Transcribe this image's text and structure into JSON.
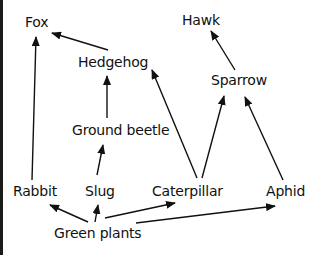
{
  "diagram": {
    "type": "food-web",
    "colors": {
      "line": "#111111",
      "text": "#111111",
      "background": "#ffffff"
    },
    "nodes": [
      {
        "id": "fox",
        "label": "Fox",
        "x": 25,
        "y": 14
      },
      {
        "id": "hawk",
        "label": "Hawk",
        "x": 182,
        "y": 12
      },
      {
        "id": "hedgehog",
        "label": "Hedgehog",
        "x": 78,
        "y": 54
      },
      {
        "id": "sparrow",
        "label": "Sparrow",
        "x": 211,
        "y": 72
      },
      {
        "id": "ground_beetle",
        "label": "Ground beetle",
        "x": 72,
        "y": 122
      },
      {
        "id": "rabbit",
        "label": "Rabbit",
        "x": 13,
        "y": 183
      },
      {
        "id": "slug",
        "label": "Slug",
        "x": 85,
        "y": 183
      },
      {
        "id": "caterpillar",
        "label": "Caterpillar",
        "x": 152,
        "y": 183
      },
      {
        "id": "aphid",
        "label": "Aphid",
        "x": 266,
        "y": 183
      },
      {
        "id": "green_plants",
        "label": "Green plants",
        "x": 54,
        "y": 225
      }
    ],
    "edges": [
      {
        "from": "hedgehog",
        "to": "fox",
        "x1": 108,
        "y1": 50,
        "x2": 52,
        "y2": 33
      },
      {
        "from": "rabbit",
        "to": "fox",
        "x1": 32,
        "y1": 180,
        "x2": 36,
        "y2": 37
      },
      {
        "from": "ground_beetle",
        "to": "hedgehog",
        "x1": 107,
        "y1": 118,
        "x2": 107,
        "y2": 76
      },
      {
        "from": "caterpillar",
        "to": "hedgehog",
        "x1": 197,
        "y1": 178,
        "x2": 152,
        "y2": 70
      },
      {
        "from": "sparrow",
        "to": "hawk",
        "x1": 235,
        "y1": 70,
        "x2": 211,
        "y2": 31
      },
      {
        "from": "caterpillar",
        "to": "sparrow",
        "x1": 202,
        "y1": 178,
        "x2": 224,
        "y2": 96
      },
      {
        "from": "aphid",
        "to": "sparrow",
        "x1": 283,
        "y1": 180,
        "x2": 245,
        "y2": 97
      },
      {
        "from": "slug",
        "to": "ground_beetle",
        "x1": 97,
        "y1": 175,
        "x2": 103,
        "y2": 145
      },
      {
        "from": "green_plants",
        "to": "rabbit",
        "x1": 88,
        "y1": 222,
        "x2": 50,
        "y2": 205
      },
      {
        "from": "green_plants",
        "to": "slug",
        "x1": 95,
        "y1": 222,
        "x2": 98,
        "y2": 205
      },
      {
        "from": "green_plants",
        "to": "caterpillar",
        "x1": 105,
        "y1": 218,
        "x2": 175,
        "y2": 203
      },
      {
        "from": "green_plants",
        "to": "aphid",
        "x1": 136,
        "y1": 223,
        "x2": 275,
        "y2": 206
      }
    ]
  }
}
